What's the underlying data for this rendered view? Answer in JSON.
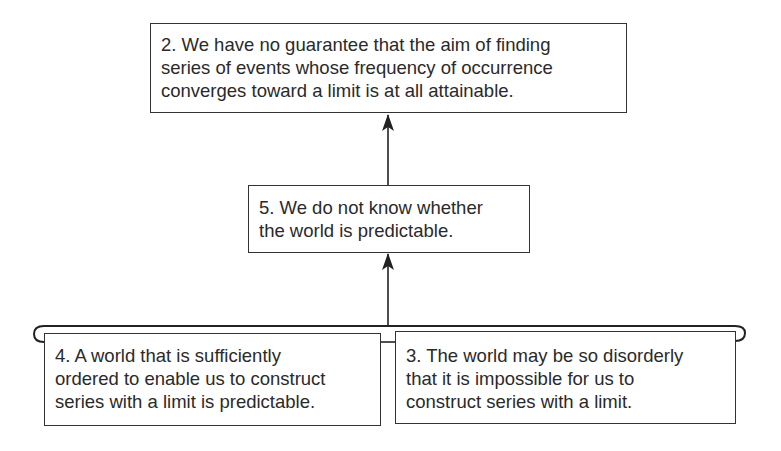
{
  "diagram": {
    "nodes": [
      {
        "id": "2",
        "lines": [
          "2. We have no guarantee that the aim of finding",
          "series of events whose frequency of occurrence",
          "converges toward a limit is at all attainable."
        ]
      },
      {
        "id": "5",
        "lines": [
          "5. We do not know whether",
          "the world is predictable."
        ]
      },
      {
        "id": "4",
        "lines": [
          "4. A world that is sufficiently",
          "ordered to enable us to construct",
          "series with a limit is predictable."
        ]
      },
      {
        "id": "3",
        "lines": [
          "3. The world may be so disorderly",
          "that it is impossible for us to",
          "construct series with a limit."
        ]
      }
    ],
    "edges": [
      {
        "from": "5",
        "to": "2",
        "type": "arrow"
      },
      {
        "from": [
          "4",
          "3"
        ],
        "to": "5",
        "type": "bracket-arrow"
      }
    ]
  }
}
